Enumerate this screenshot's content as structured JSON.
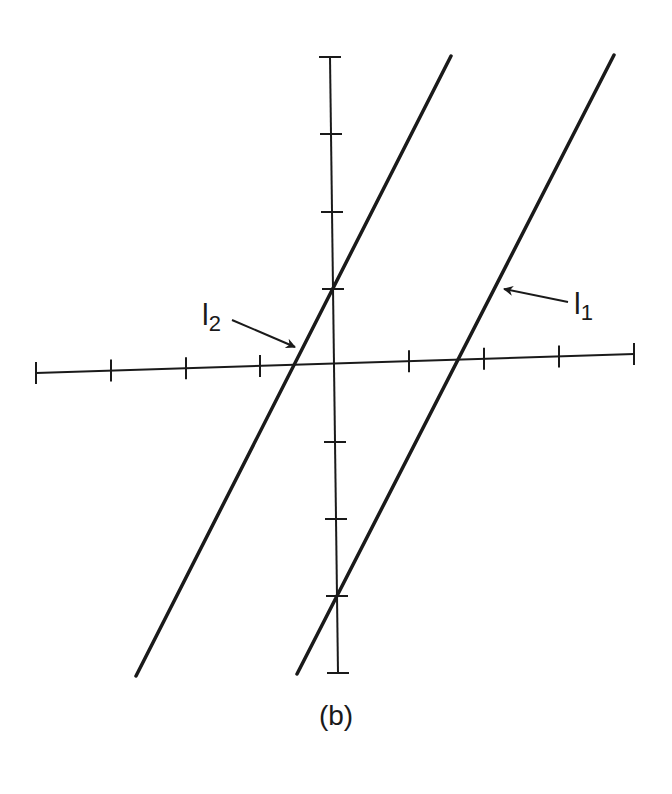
{
  "figure": {
    "caption": "(b)",
    "stroke_color": "#1a1a1a",
    "background": "#ffffff"
  },
  "axes": {
    "x_axis": {
      "start": [
        36,
        373
      ],
      "end": [
        634,
        354
      ],
      "ticks_x": [
        36,
        111,
        186,
        260,
        409,
        484,
        559,
        634
      ]
    },
    "y_axis": {
      "start": [
        330,
        57
      ],
      "end": [
        338,
        673
      ],
      "ticks_y": [
        57,
        134,
        212,
        289,
        442,
        519,
        596,
        673
      ]
    }
  },
  "lines": [
    {
      "id": "l1",
      "label_main": "l",
      "label_sub": "1",
      "from": [
        297,
        674
      ],
      "to": [
        614,
        55
      ],
      "label_pos": [
        574,
        287
      ],
      "arrow_from": [
        568,
        302
      ],
      "arrow_to": [
        504,
        289
      ]
    },
    {
      "id": "l2",
      "label_main": "l",
      "label_sub": "2",
      "from": [
        136,
        676
      ],
      "to": [
        451,
        56
      ],
      "label_pos": [
        202,
        298
      ],
      "arrow_from": [
        232,
        320
      ],
      "arrow_to": [
        295,
        347
      ]
    }
  ],
  "chart_data": {
    "type": "line",
    "title": "",
    "caption": "(b)",
    "xlabel": "",
    "ylabel": "",
    "xlim": [
      -4,
      4
    ],
    "ylim": [
      -4,
      4
    ],
    "grid": false,
    "series": [
      {
        "name": "l1",
        "slope": 2,
        "intercept": -3,
        "x": [
          -0.5,
          3.5
        ],
        "y": [
          -4,
          4
        ]
      },
      {
        "name": "l2",
        "slope": 2,
        "intercept": 1,
        "x": [
          -2.5,
          1.5
        ],
        "y": [
          -4,
          4
        ]
      }
    ],
    "annotations": [
      "l1",
      "l2"
    ]
  }
}
